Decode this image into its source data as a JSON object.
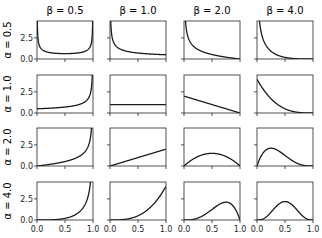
{
  "chart_data": {
    "type": "line",
    "layout": {
      "rows": 4,
      "cols": 4,
      "grid": false,
      "legend": null
    },
    "column_titles": [
      "β = 0.5",
      "β = 1.0",
      "β = 2.0",
      "β = 4.0"
    ],
    "row_labels": [
      "α = 0.5",
      "α = 1.0",
      "α = 2.0",
      "α = 4.0"
    ],
    "alphas": [
      0.5,
      1.0,
      2.0,
      4.0
    ],
    "betas": [
      0.5,
      1.0,
      2.0,
      4.0
    ],
    "xlim": [
      0,
      1
    ],
    "ylim": [
      0,
      4.5
    ],
    "x_ticks": [
      0.0,
      0.5,
      1.0
    ],
    "x_tick_labels": [
      "0.0",
      "0.5",
      "1.0"
    ],
    "y_ticks": [
      0.0,
      2.5
    ],
    "y_tick_labels": [
      "0.0",
      "2.5"
    ],
    "xlabel": "",
    "ylabel": "",
    "line_color": "#1a1a1a",
    "series_description": "Each panel plots Beta(x; α, β) pdf over x in [0,1], clipped at y = 4.5"
  },
  "figure": {
    "col_titles": [
      "β = 0.5",
      "β = 1.0",
      "β = 2.0",
      "β = 4.0"
    ],
    "row_labels": [
      "α = 0.5",
      "α = 1.0",
      "α = 2.0",
      "α = 4.0"
    ],
    "x_tick_labels": [
      "0.0",
      "0.5",
      "1.0"
    ],
    "y_tick_labels": [
      "0.0",
      "2.5"
    ]
  }
}
